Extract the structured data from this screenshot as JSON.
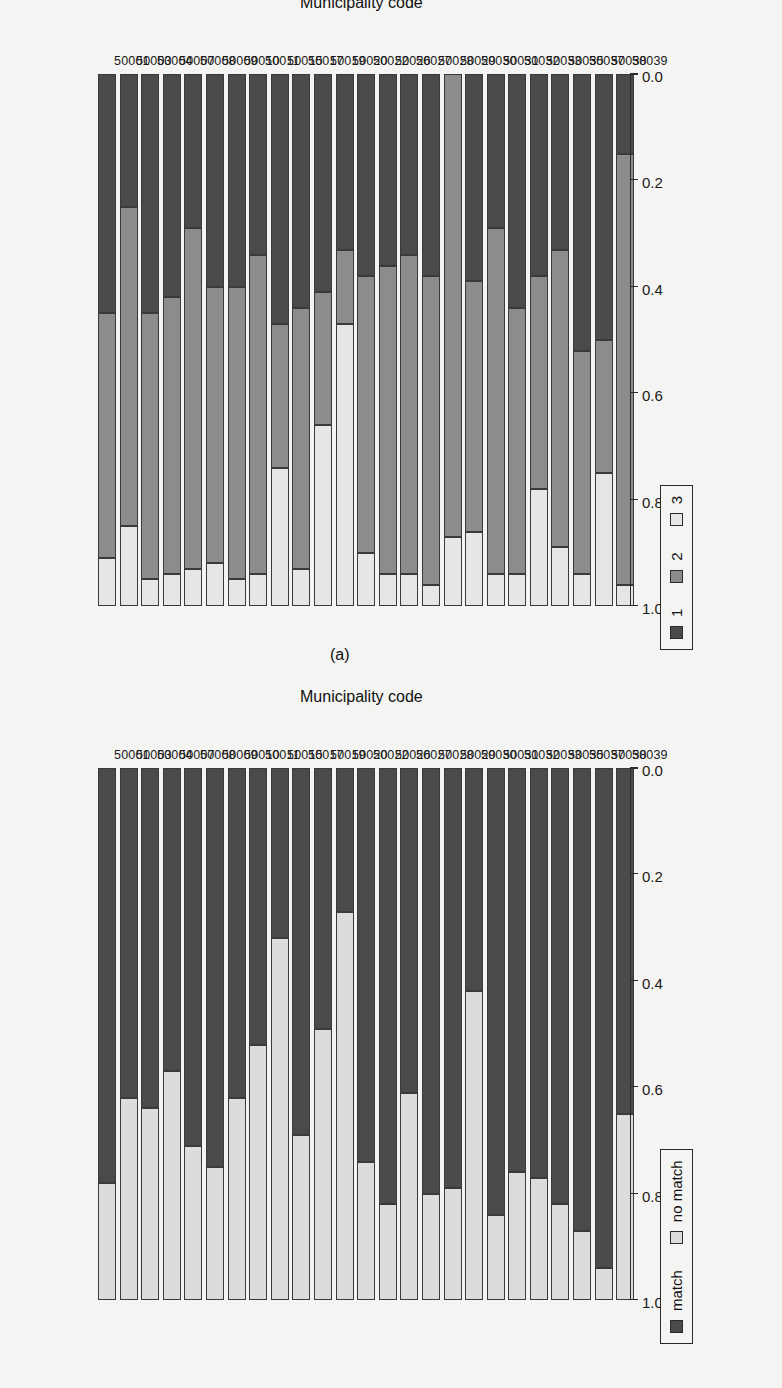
{
  "figure": {
    "panels": [
      {
        "tag": "(a)",
        "axis_title": "Municipality code"
      },
      {
        "tag": "(b)",
        "axis_title": "Municipality code"
      }
    ]
  },
  "value_axis": {
    "ticks": [
      "1.0",
      "0.8",
      "0.6",
      "0.4",
      "0.2",
      "0.0"
    ],
    "min": 0.0,
    "max": 1.0
  },
  "legend_a": {
    "items": [
      {
        "label": "match",
        "color": "#4a4a4a"
      },
      {
        "label": "no match",
        "color": "#dcdcdc"
      }
    ]
  },
  "legend_b": {
    "items": [
      {
        "label": "1",
        "color": "#4a4a4a"
      },
      {
        "label": "2",
        "color": "#8c8c8c"
      },
      {
        "label": "3",
        "color": "#e6e6e6"
      }
    ]
  },
  "chart_data": [
    {
      "type": "bar",
      "subtype": "stacked-horizontal-proportional",
      "title": "(a)",
      "xlabel": "Municipality code",
      "ylabel": "",
      "ylim": [
        0.0,
        1.0
      ],
      "grid": false,
      "legend_position": "top-left",
      "legend_entries": [
        "match",
        "no match"
      ],
      "categories": [
        "50001",
        "50003",
        "50004",
        "50007",
        "50008",
        "50009",
        "50010",
        "50011",
        "50015",
        "50017",
        "50019",
        "50020",
        "50022",
        "50026",
        "50027",
        "50028",
        "50029",
        "50030",
        "50031",
        "50032",
        "50033",
        "50035",
        "50037",
        "50038",
        "50039"
      ],
      "series": [
        {
          "name": "match",
          "color": "#4a4a4a",
          "values": [
            0.78,
            0.62,
            0.64,
            0.57,
            0.71,
            0.75,
            0.62,
            0.52,
            0.32,
            0.69,
            0.49,
            0.27,
            0.74,
            0.82,
            0.61,
            0.8,
            0.79,
            0.42,
            0.84,
            0.76,
            0.77,
            0.82,
            0.87,
            0.94,
            0.65
          ]
        },
        {
          "name": "no match",
          "color": "#dcdcdc",
          "values": [
            0.22,
            0.38,
            0.36,
            0.43,
            0.29,
            0.25,
            0.38,
            0.48,
            0.68,
            0.31,
            0.51,
            0.73,
            0.26,
            0.18,
            0.39,
            0.2,
            0.21,
            0.58,
            0.16,
            0.24,
            0.23,
            0.18,
            0.13,
            0.06,
            0.35
          ]
        }
      ]
    },
    {
      "type": "bar",
      "subtype": "stacked-horizontal-proportional",
      "title": "(b)",
      "xlabel": "Municipality code",
      "ylabel": "",
      "ylim": [
        0.0,
        1.0
      ],
      "grid": false,
      "legend_position": "top-left",
      "legend_entries": [
        "1",
        "2",
        "3"
      ],
      "categories": [
        "50001",
        "50003",
        "50004",
        "50007",
        "50008",
        "50009",
        "50010",
        "50011",
        "50015",
        "50017",
        "50019",
        "50020",
        "50022",
        "50026",
        "50027",
        "50028",
        "50029",
        "50030",
        "50031",
        "50032",
        "50033",
        "50035",
        "50037",
        "50038",
        "50039"
      ],
      "series": [
        {
          "name": "1",
          "color": "#4a4a4a",
          "values": [
            0.45,
            0.25,
            0.45,
            0.42,
            0.29,
            0.4,
            0.4,
            0.34,
            0.47,
            0.44,
            0.41,
            0.33,
            0.38,
            0.36,
            0.34,
            0.38,
            0.0,
            0.39,
            0.29,
            0.44,
            0.38,
            0.33,
            0.52,
            0.5,
            0.15
          ]
        },
        {
          "name": "2",
          "color": "#8c8c8c",
          "values": [
            0.46,
            0.6,
            0.5,
            0.52,
            0.64,
            0.52,
            0.55,
            0.6,
            0.27,
            0.49,
            0.25,
            0.14,
            0.52,
            0.58,
            0.6,
            0.58,
            0.87,
            0.47,
            0.65,
            0.5,
            0.4,
            0.56,
            0.42,
            0.25,
            0.81
          ]
        },
        {
          "name": "3",
          "color": "#e6e6e6",
          "values": [
            0.09,
            0.15,
            0.05,
            0.06,
            0.07,
            0.08,
            0.05,
            0.06,
            0.26,
            0.07,
            0.34,
            0.53,
            0.1,
            0.06,
            0.06,
            0.04,
            0.13,
            0.14,
            0.06,
            0.06,
            0.22,
            0.11,
            0.06,
            0.25,
            0.04
          ]
        }
      ]
    }
  ]
}
